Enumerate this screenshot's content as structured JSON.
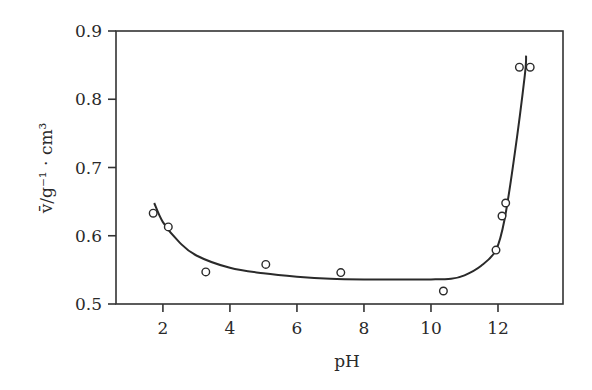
{
  "chart_data": {
    "type": "scatter",
    "title": "",
    "xlabel": "pH",
    "ylabel": "v̄/g⁻¹ · cm³",
    "xlim": [
      0.6,
      13.94
    ],
    "ylim": [
      0.5,
      0.9
    ],
    "x_ticks": [
      2,
      4,
      6,
      8,
      10,
      12
    ],
    "x_tick_labels": [
      "2",
      "4",
      "6",
      "8",
      "10",
      "12"
    ],
    "y_ticks": [
      0.5,
      0.6,
      0.7,
      0.8,
      0.9
    ],
    "y_tick_labels": [
      "0.5",
      "0.6",
      "0.7",
      "0.8",
      "0.9"
    ],
    "grid": false,
    "legend": null,
    "series": [
      {
        "name": "measured",
        "style": "open-circle-markers",
        "x": [
          1.71,
          2.16,
          3.28,
          5.07,
          7.31,
          10.37,
          11.94,
          12.12,
          12.23,
          12.64,
          12.96
        ],
        "y": [
          0.633,
          0.613,
          0.547,
          0.558,
          0.546,
          0.519,
          0.579,
          0.629,
          0.648,
          0.847,
          0.847
        ]
      },
      {
        "name": "fitted curve",
        "style": "solid-line",
        "x": [
          1.74,
          2.0,
          2.5,
          3.0,
          4.0,
          5.0,
          6.0,
          7.0,
          8.0,
          9.0,
          10.0,
          10.6,
          11.0,
          11.5,
          11.94,
          12.2,
          12.5,
          12.8,
          12.84
        ],
        "y": [
          0.648,
          0.62,
          0.59,
          0.571,
          0.553,
          0.545,
          0.54,
          0.537,
          0.536,
          0.536,
          0.536,
          0.537,
          0.542,
          0.556,
          0.579,
          0.625,
          0.72,
          0.835,
          0.864
        ]
      }
    ]
  }
}
